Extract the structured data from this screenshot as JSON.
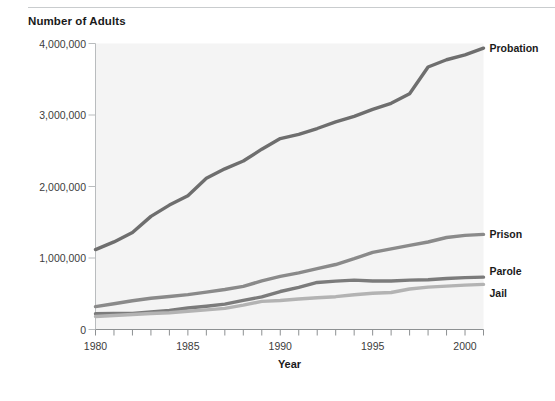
{
  "chart_data": {
    "type": "line",
    "title": "",
    "ylabel": "Number of Adults",
    "xlabel": "Year",
    "xlim": [
      1980,
      2001
    ],
    "ylim": [
      0,
      4000000
    ],
    "grid": false,
    "legend_position": "right-of-plot (inline end labels)",
    "x_tick_labels": [
      "1980",
      "1985",
      "1990",
      "1995",
      "2000"
    ],
    "x_tick_values": [
      1980,
      1985,
      1990,
      1995,
      2000
    ],
    "x_minor_tick_values": [
      1980,
      1981,
      1982,
      1983,
      1984,
      1985,
      1986,
      1987,
      1988,
      1989,
      1990,
      1991,
      1992,
      1993,
      1994,
      1995,
      1996,
      1997,
      1998,
      1999,
      2000,
      2001
    ],
    "y_tick_labels": [
      "0",
      "1,000,000",
      "2,000,000",
      "3,000,000",
      "4,000,000"
    ],
    "y_tick_values": [
      0,
      1000000,
      2000000,
      3000000,
      4000000
    ],
    "x": [
      1980,
      1981,
      1982,
      1983,
      1984,
      1985,
      1986,
      1987,
      1988,
      1989,
      1990,
      1991,
      1992,
      1993,
      1994,
      1995,
      1996,
      1997,
      1998,
      1999,
      2000,
      2001
    ],
    "series": [
      {
        "name": "Probation",
        "color": "#6e6e6e",
        "label_color": "#1a1a1a",
        "values": [
          1118000,
          1225000,
          1357000,
          1582000,
          1740000,
          1870000,
          2114000,
          2247000,
          2356000,
          2522000,
          2670000,
          2729000,
          2811000,
          2903000,
          2981000,
          3078000,
          3164000,
          3297000,
          3671000,
          3773000,
          3840000,
          3935000
        ]
      },
      {
        "name": "Prison",
        "color": "#8a8a8a",
        "label_color": "#1a1a1a",
        "values": [
          320000,
          360000,
          402000,
          437000,
          462000,
          487000,
          523000,
          560000,
          603000,
          680000,
          743000,
          792000,
          851000,
          909000,
          990000,
          1078000,
          1127000,
          1176000,
          1224000,
          1287000,
          1316000,
          1331000
        ]
      },
      {
        "name": "Parole",
        "color": "#7b7b7b",
        "label_color": "#1a1a1a",
        "values": [
          220000,
          225000,
          224000,
          246000,
          266000,
          300000,
          326000,
          355000,
          407000,
          456000,
          531000,
          590000,
          658000,
          676000,
          690000,
          679000,
          679000,
          690000,
          696000,
          714000,
          726000,
          732000
        ]
      },
      {
        "name": "Jail",
        "color": "#b3b3b3",
        "label_color": "#1a1a1a",
        "values": [
          182000,
          196000,
          209000,
          223000,
          234000,
          256000,
          274000,
          295000,
          341000,
          393000,
          405000,
          426000,
          444000,
          459000,
          486000,
          507000,
          518000,
          567000,
          592000,
          606000,
          621000,
          631000
        ]
      }
    ]
  },
  "figure": {
    "y_axis_title": "Number of Adults",
    "x_axis_title": "Year"
  }
}
